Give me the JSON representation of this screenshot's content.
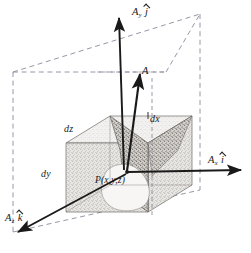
{
  "figure": {
    "background_color": "#ffffff",
    "ink_color": "#1a1a1a",
    "dashed_color": "#8d8a9c",
    "shading_color": "#b9b6b2"
  },
  "labels": {
    "vector_a": "A",
    "component_y": {
      "symbol": "A",
      "subscript": "y",
      "unit": "j"
    },
    "component_x": {
      "symbol": "A",
      "subscript": "x",
      "unit": "i"
    },
    "component_z": {
      "symbol": "A",
      "subscript": "z",
      "unit": "k"
    },
    "edge_dz": "dz",
    "edge_dx": "dx",
    "edge_dy": "dy",
    "point": "P(x,y,z)"
  },
  "geometry": {
    "point_coords": {
      "x": 127,
      "y": 172
    },
    "cube": {
      "front_top_left": {
        "x": 66,
        "y": 143
      },
      "front_top_right": {
        "x": 148,
        "y": 143
      },
      "front_bottom_left": {
        "x": 66,
        "y": 212
      },
      "front_bottom_right": {
        "x": 148,
        "y": 212
      },
      "depth_dx": 44,
      "depth_dy": 27
    },
    "outer_box": {
      "near_top_left": {
        "x": 13,
        "y": 72
      },
      "near_top_right": {
        "x": 166,
        "y": 72
      },
      "far_top_right": {
        "x": 200,
        "y": 14
      },
      "near_bottom_left": {
        "x": 13,
        "y": 232
      },
      "far_bottom_right": {
        "x": 200,
        "y": 190
      }
    },
    "arrows": {
      "ay_tip": {
        "x": 119,
        "y": 16
      },
      "ay_tail": {
        "x": 125,
        "y": 170
      },
      "ax_tip": {
        "x": 243,
        "y": 170
      },
      "ax_tail": {
        "x": 128,
        "y": 172
      },
      "az_tip": {
        "x": 16,
        "y": 233
      },
      "az_tail": {
        "x": 126,
        "y": 174
      },
      "a_tip": {
        "x": 140,
        "y": 72
      },
      "a_tail": {
        "x": 127,
        "y": 171
      }
    }
  }
}
